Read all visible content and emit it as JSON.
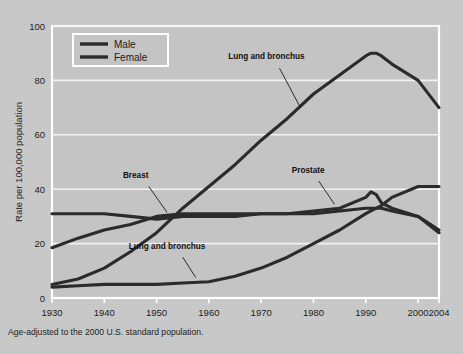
{
  "figure": {
    "background_color": "#c9c9c9",
    "plot_color": "#c4c4c4",
    "grid_color": "#f2f2f2",
    "line_color": "#2b2b2b",
    "footnote": "Age-adjusted to the 2000 U.S. standard population."
  },
  "legend": {
    "position": "top-left-inside",
    "entries": [
      {
        "label": "Male",
        "color": "#2b2b2b"
      },
      {
        "label": "Female",
        "color": "#2b2b2b"
      }
    ]
  },
  "annotations": [
    {
      "id": "lung-male",
      "text": "Lung and bronchus",
      "x": 1971,
      "y": 88
    },
    {
      "id": "breast",
      "text": "Breast",
      "x": 1946,
      "y": 44
    },
    {
      "id": "prostate",
      "text": "Prostate",
      "x": 1979,
      "y": 46
    },
    {
      "id": "lung-female",
      "text": "Lung and bronchus",
      "x": 1952,
      "y": 18
    }
  ],
  "chart_data": {
    "type": "line",
    "title": "",
    "subtitle": "",
    "xlabel": "",
    "ylabel": "Rate per 100,000 population",
    "xlim": [
      1930,
      2004
    ],
    "ylim": [
      0,
      100
    ],
    "xticks": [
      1930,
      1940,
      1950,
      1960,
      1970,
      1980,
      1990,
      2000,
      2004
    ],
    "xticklabels": [
      "1930",
      "1940",
      "1950",
      "1960",
      "1970",
      "1980",
      "1990",
      "2000",
      "2004"
    ],
    "yticks": [
      0,
      20,
      40,
      60,
      80,
      100
    ],
    "yticklabels": [
      "0",
      "20",
      "40",
      "60",
      "80",
      "100"
    ],
    "grid": "horizontal",
    "legend_entries": [
      "Male",
      "Female"
    ],
    "x": [
      1930,
      1935,
      1940,
      1945,
      1950,
      1955,
      1960,
      1965,
      1970,
      1975,
      1980,
      1985,
      1990,
      1991,
      1992,
      1993,
      1995,
      2000,
      2004
    ],
    "series": [
      {
        "name": "Lung and bronchus (Male)",
        "sex": "Male",
        "color": "#2b2b2b",
        "values": [
          5,
          7,
          11,
          17,
          24,
          33,
          41,
          49,
          58,
          66,
          75,
          82,
          89,
          90,
          90,
          89,
          86,
          80,
          70
        ]
      },
      {
        "name": "Prostate (Male)",
        "sex": "Male",
        "color": "#2b2b2b",
        "values": [
          31,
          31,
          31,
          30,
          29,
          30,
          30,
          30,
          31,
          31,
          32,
          33,
          37,
          39,
          38,
          35,
          33,
          30,
          25
        ]
      },
      {
        "name": "Breast (Female)",
        "sex": "Female",
        "color": "#2b2b2b",
        "values": [
          18.5,
          22,
          25,
          27,
          30,
          31,
          31,
          31,
          31,
          31,
          31,
          32,
          33,
          33,
          33,
          33,
          32,
          30,
          24
        ]
      },
      {
        "name": "Lung and bronchus (Female)",
        "sex": "Female",
        "color": "#2b2b2b",
        "values": [
          4,
          4.5,
          5,
          5,
          5,
          5.5,
          6,
          8,
          11,
          15,
          20,
          25,
          31,
          32,
          33,
          34,
          37,
          41,
          41
        ]
      }
    ]
  }
}
